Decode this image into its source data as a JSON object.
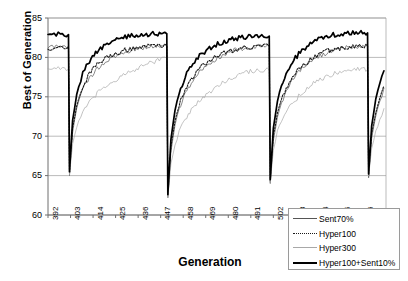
{
  "chart_data": {
    "type": "line",
    "title": "",
    "subtitle": "",
    "xlabel": "Generation",
    "ylabel": "Best of Generation",
    "xlim": [
      392,
      557
    ],
    "ylim": [
      60,
      85
    ],
    "ytick_labels": [
      "85",
      "80",
      "75",
      "70",
      "65",
      "60"
    ],
    "ytick_values": [
      85,
      80,
      75,
      70,
      65,
      60
    ],
    "xtick_labels": [
      "392",
      "403",
      "414",
      "425",
      "436",
      "447",
      "458",
      "469",
      "480",
      "491",
      "502",
      "513",
      "524",
      "535",
      "546"
    ],
    "xtick_values": [
      392,
      403,
      414,
      425,
      436,
      447,
      458,
      469,
      480,
      491,
      502,
      513,
      524,
      535,
      546
    ],
    "grid": "horizontal",
    "legend_position": "bottom-right",
    "legend": [
      "Sent70%",
      "Hyper100",
      "Hyper300",
      "Hyper100+Sent10%"
    ],
    "restart_generations": [
      402,
      450,
      500,
      548
    ],
    "series": [
      {
        "name": "Sent70%",
        "style": "thin-solid",
        "color": "#555555",
        "x": [
          392,
          394,
          396,
          398,
          400,
          402,
          402.5,
          404,
          406,
          408,
          410,
          413,
          416,
          420,
          424,
          428,
          432,
          436,
          440,
          444,
          448,
          450,
          450.5,
          452,
          454,
          456,
          459,
          462,
          466,
          470,
          474,
          478,
          482,
          486,
          490,
          494,
          498,
          500,
          500.5,
          502,
          504,
          506,
          509,
          512,
          516,
          520,
          524,
          528,
          532,
          536,
          540,
          544,
          548,
          548.5,
          550,
          552,
          554,
          556
        ],
        "y": [
          81.3,
          81.3,
          81.4,
          81.4,
          81.4,
          81.4,
          65.0,
          70.5,
          73.6,
          75.3,
          76.5,
          77.6,
          78.6,
          79.4,
          80.0,
          80.5,
          80.9,
          81.1,
          81.3,
          81.4,
          81.5,
          81.5,
          62.2,
          68.0,
          71.5,
          73.5,
          75.4,
          76.8,
          78.2,
          79.2,
          79.8,
          80.4,
          80.8,
          81.1,
          81.3,
          81.4,
          81.5,
          81.5,
          64.0,
          69.5,
          72.4,
          74.2,
          76.0,
          77.3,
          78.6,
          79.5,
          80.1,
          80.6,
          80.9,
          81.2,
          81.3,
          81.4,
          81.4,
          64.8,
          69.8,
          72.6,
          74.5,
          76.1
        ]
      },
      {
        "name": "Hyper100",
        "style": "dotted",
        "color": "#1a1a1a",
        "x": [
          392,
          394,
          396,
          398,
          400,
          402,
          402.5,
          404,
          406,
          408,
          410,
          413,
          416,
          420,
          424,
          428,
          432,
          436,
          440,
          444,
          448,
          450,
          450.5,
          452,
          454,
          456,
          459,
          462,
          466,
          470,
          474,
          478,
          482,
          486,
          490,
          494,
          498,
          500,
          500.5,
          502,
          504,
          506,
          509,
          512,
          516,
          520,
          524,
          528,
          532,
          536,
          540,
          544,
          548,
          548.5,
          550,
          552,
          554,
          556
        ],
        "y": [
          81.1,
          81.2,
          81.2,
          81.3,
          81.3,
          81.3,
          65.3,
          71.0,
          73.9,
          75.6,
          76.9,
          78.2,
          79.1,
          79.9,
          80.4,
          80.8,
          81.1,
          81.3,
          81.4,
          81.5,
          81.5,
          81.5,
          62.5,
          68.6,
          72.0,
          74.0,
          75.9,
          77.3,
          78.6,
          79.5,
          80.1,
          80.6,
          80.9,
          81.2,
          81.3,
          81.4,
          81.5,
          81.5,
          64.3,
          70.0,
          72.9,
          74.7,
          76.4,
          77.7,
          78.9,
          79.7,
          80.3,
          80.8,
          81.0,
          81.2,
          81.4,
          81.4,
          81.4,
          65.0,
          70.2,
          73.0,
          74.9,
          76.4
        ]
      },
      {
        "name": "Hyper300",
        "style": "thin-light",
        "color": "#a8a8a8",
        "x": [
          392,
          394,
          396,
          398,
          400,
          402,
          402.5,
          404,
          406,
          408,
          410,
          413,
          416,
          420,
          424,
          428,
          432,
          436,
          440,
          444,
          448,
          450,
          450.5,
          452,
          454,
          456,
          459,
          462,
          466,
          470,
          474,
          478,
          482,
          486,
          490,
          494,
          498,
          500,
          500.5,
          502,
          504,
          506,
          509,
          512,
          516,
          520,
          524,
          528,
          532,
          536,
          540,
          544,
          548,
          548.5,
          550,
          552,
          554,
          556
        ],
        "y": [
          78.6,
          78.6,
          78.7,
          78.7,
          78.6,
          78.5,
          65.1,
          69.0,
          71.2,
          72.6,
          73.5,
          74.5,
          75.4,
          76.3,
          77.0,
          77.6,
          78.1,
          78.6,
          79.1,
          79.5,
          79.8,
          79.9,
          62.2,
          66.5,
          69.0,
          70.6,
          72.2,
          73.3,
          74.5,
          75.4,
          76.2,
          76.9,
          77.5,
          77.9,
          78.2,
          78.4,
          78.4,
          78.4,
          64.1,
          68.2,
          70.5,
          71.9,
          73.3,
          74.4,
          75.5,
          76.4,
          77.1,
          77.6,
          78.0,
          78.3,
          78.5,
          78.5,
          78.5,
          64.9,
          68.4,
          70.7,
          72.2,
          73.5
        ]
      },
      {
        "name": "Hyper100+Sent10%",
        "style": "thick-solid",
        "color": "#000000",
        "x": [
          392,
          394,
          396,
          398,
          400,
          402,
          402.5,
          404,
          406,
          408,
          410,
          413,
          416,
          420,
          424,
          428,
          432,
          436,
          440,
          444,
          448,
          450,
          450.5,
          452,
          454,
          456,
          459,
          462,
          466,
          470,
          474,
          478,
          482,
          486,
          490,
          494,
          498,
          500,
          500.5,
          502,
          504,
          506,
          509,
          512,
          516,
          520,
          524,
          528,
          532,
          536,
          540,
          544,
          548,
          548.5,
          550,
          552,
          554,
          556
        ],
        "y": [
          82.9,
          82.9,
          83.0,
          83.0,
          82.9,
          82.9,
          65.5,
          72.0,
          75.3,
          77.2,
          78.6,
          79.9,
          80.8,
          81.5,
          82.1,
          82.5,
          82.7,
          82.8,
          82.9,
          83.0,
          83.0,
          83.0,
          62.6,
          69.5,
          73.3,
          75.5,
          77.6,
          79.0,
          80.2,
          81.0,
          81.6,
          82.0,
          82.3,
          82.5,
          82.6,
          82.7,
          82.7,
          82.7,
          64.5,
          71.0,
          74.5,
          76.5,
          78.4,
          79.7,
          80.9,
          81.7,
          82.3,
          82.7,
          82.9,
          83.0,
          83.1,
          83.1,
          83.1,
          65.2,
          71.3,
          74.7,
          76.8,
          78.3
        ]
      }
    ]
  },
  "axes": {
    "plot_left": 48,
    "plot_right": 386,
    "plot_top": 18,
    "plot_bottom": 215
  }
}
